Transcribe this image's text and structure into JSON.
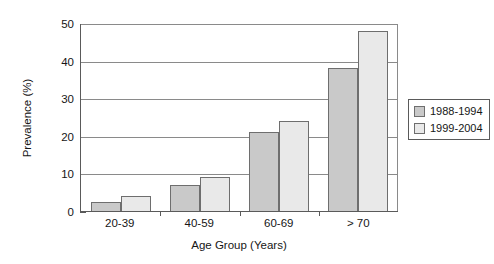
{
  "chart_data": {
    "type": "bar",
    "title": "",
    "subtitle": "",
    "xlabel": "Age Group (Years)",
    "ylabel": "Prevalence (%)",
    "categories": [
      "20-39",
      "40-59",
      "60-69",
      "> 70"
    ],
    "series": [
      {
        "name": "1988-1994",
        "color": "#c9c9c9",
        "values": [
          2.3,
          7.0,
          21.0,
          38.0
        ]
      },
      {
        "name": "1999-2004",
        "color": "#e9e9e9",
        "values": [
          4.0,
          9.0,
          24.0,
          48.0
        ]
      }
    ],
    "ylim": [
      0,
      50
    ],
    "yticks": [
      0,
      10,
      20,
      30,
      40,
      50
    ],
    "ytick_labels": [
      "0",
      "10",
      "20",
      "30",
      "40",
      "50"
    ],
    "grid": "horizontal",
    "legend_position": "right",
    "annotations": []
  },
  "legend": {
    "items": [
      {
        "label": "1988-1994",
        "swatch": "series-0-swatch"
      },
      {
        "label": "1999-2004",
        "swatch": "series-1-swatch"
      }
    ]
  }
}
